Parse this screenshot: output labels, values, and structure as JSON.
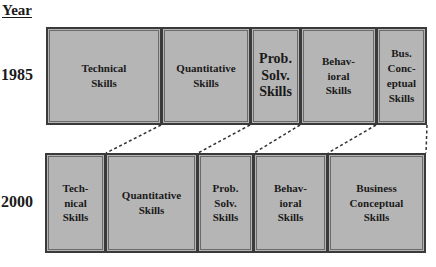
{
  "header": {
    "year_label": "Year"
  },
  "rows": [
    {
      "year": "1985",
      "boxes": [
        {
          "label": "Technical\nSkills"
        },
        {
          "label": "Quantitative\nSkills"
        },
        {
          "label": "Prob.\nSolv.\nSkills"
        },
        {
          "label": "Behav-\nioral\nSkills"
        },
        {
          "label": "Bus.\nConc-\neptual\nSkills"
        }
      ]
    },
    {
      "year": "2000",
      "boxes": [
        {
          "label": "Tech-\nnical\nSkills"
        },
        {
          "label": "Quantitative\nSkills"
        },
        {
          "label": "Prob.\nSolv.\nSkills"
        },
        {
          "label": "Behav-\nioral\nSkills"
        },
        {
          "label": "Business\nConceptual\nSkills"
        }
      ]
    }
  ],
  "colors": {
    "box_fill": "#b5b5b5",
    "box_border": "#3a3a3a",
    "connector": "#333333"
  }
}
